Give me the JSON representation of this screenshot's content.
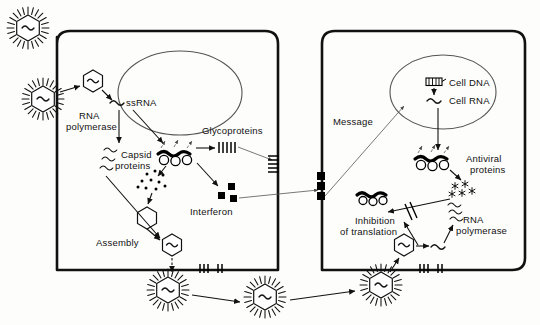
{
  "figure": {
    "background_color": "#fdfdfb",
    "ink_color": "#111111"
  },
  "labels": {
    "ss_rna": "ssRNA",
    "rna_polymerase_left": "RNA",
    "rna_polymerase_left2": "polymerase",
    "capsid": "Capsid",
    "capsid2": "proteins",
    "glycoproteins": "Glycoproteins",
    "interferon": "Interferon",
    "assembly": "Assembly",
    "message": "Message",
    "cell_dna": "Cell DNA",
    "cell_rna": "Cell RNA",
    "antiviral": "Antiviral",
    "antiviral2": "proteins",
    "inhibition": "Inhibition",
    "inhibition2": "of  translation",
    "rna_polymerase_right": "RNA",
    "rna_polymerase_right2": "polymerase"
  },
  "icons": {
    "virion": "enveloped-virus-particle",
    "capsid_hexagon": "hexagonal-capsid",
    "rna_squiggle": "rna-strand",
    "ribosome": "ribosome-polysome",
    "interferon_square": "interferon-molecule",
    "antiviral_star": "antiviral-protein",
    "dna_ladder": "double-stranded-dna",
    "block_marks": "blocked-pathway-slash",
    "membrane_spike": "membrane-glycoprotein-spike"
  },
  "cells": {
    "infected": {
      "name": "virus-infected-cell",
      "nucleus": "nucleus"
    },
    "neighbor": {
      "name": "interferon-responding-cell",
      "nucleus": "nucleus"
    }
  },
  "counts": {
    "free_virions_bottom": 3,
    "interferon_squares": 3,
    "receptor_squares": 3,
    "ribosome_circles": 3,
    "mrna_waves_left": 3,
    "antiviral_stars": 3
  }
}
